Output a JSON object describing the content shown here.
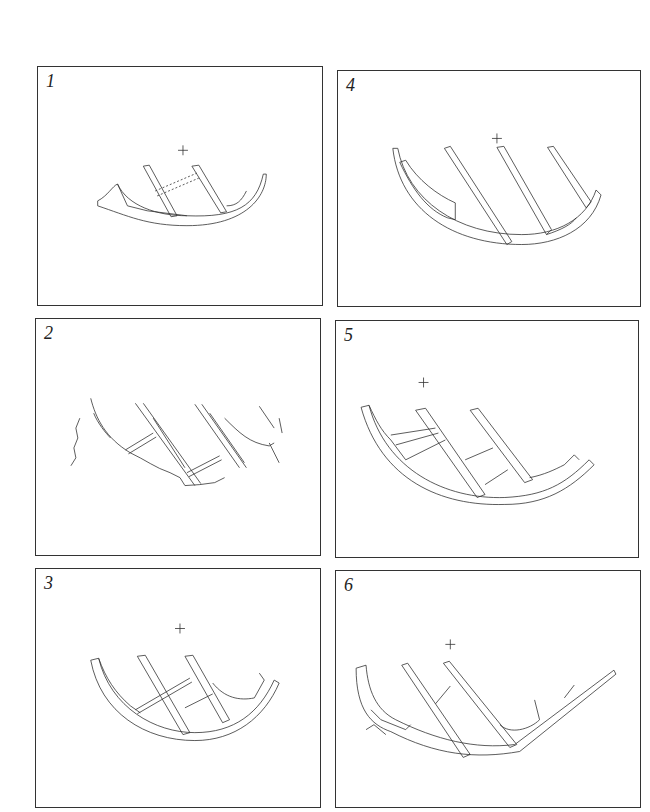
{
  "figure": {
    "panels": [
      {
        "id": "1",
        "label": "1"
      },
      {
        "id": "2",
        "label": "2"
      },
      {
        "id": "3",
        "label": "3"
      },
      {
        "id": "4",
        "label": "4"
      },
      {
        "id": "5",
        "label": "5"
      },
      {
        "id": "6",
        "label": "6"
      }
    ]
  }
}
